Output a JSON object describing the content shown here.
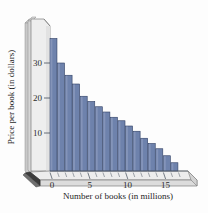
{
  "chart_data": {
    "type": "bar",
    "title": "",
    "xlabel": "Number of books (in millions)",
    "ylabel": "Price per book (in dollars)",
    "x": [
      0,
      1,
      2,
      3,
      4,
      5,
      6,
      7,
      8,
      9,
      10,
      11,
      12,
      13,
      14,
      15,
      16
    ],
    "values": [
      37,
      30,
      26.5,
      24,
      20.5,
      19,
      17.5,
      16,
      14.5,
      13.5,
      12,
      10.5,
      8.5,
      7,
      5.5,
      3.5,
      1.5
    ],
    "categories": [
      "0",
      "1",
      "2",
      "3",
      "4",
      "5",
      "6",
      "7",
      "8",
      "9",
      "10",
      "11",
      "12",
      "13",
      "14",
      "15",
      "16"
    ],
    "xticks": [
      0,
      5,
      10,
      15
    ],
    "xtick_labels": [
      "0",
      "5",
      "10",
      "15"
    ],
    "yticks": [
      10,
      20,
      30
    ],
    "ytick_labels": [
      "10",
      "20",
      "30"
    ],
    "xlim": [
      -0.5,
      17.5
    ],
    "ylim": [
      0,
      40
    ],
    "grid": false,
    "legend": false,
    "bar_color": "#6e82ac",
    "bar_edge_color": "#2f3f63",
    "wall_color": "#ececec",
    "floor_color": "#e6e6e6",
    "axis_line_color": "#555f6b",
    "background": "#fdfdfd",
    "style": "3d-perspective"
  },
  "axes": {
    "y_axis_title": "Price per book (in dollars)",
    "x_axis_title": "Number of books (in millions)"
  }
}
